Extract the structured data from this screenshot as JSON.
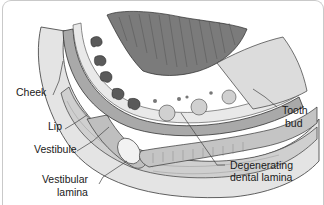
{
  "figure": {
    "type": "anatomical illustration"
  },
  "labels": {
    "cheek": "Cheek",
    "lip": "Lip",
    "vestibule": "Vestibule",
    "vestibular_lamina_line1": "Vestibular",
    "vestibular_lamina_line2": "lamina",
    "tooth_bud_line1": "Tooth",
    "tooth_bud_line2": "bud",
    "degenerating_line1": "Degenerating",
    "degenerating_line2": "dental lamina"
  },
  "colors": {
    "tissue_light": "#e6e6e6",
    "tissue_mid": "#bdbdbd",
    "tissue_dark": "#6e6e6e",
    "outline": "#3a3a3a",
    "leader_line": "#444444"
  }
}
